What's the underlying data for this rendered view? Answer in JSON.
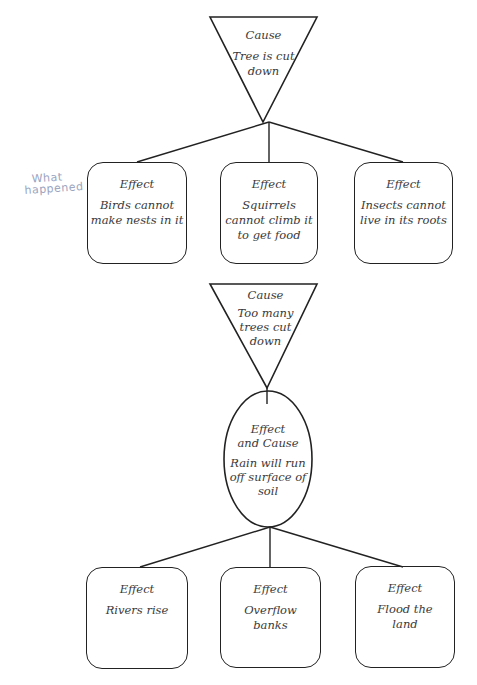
{
  "annotation": {
    "line1": "What",
    "line2": "happened"
  },
  "diagram1": {
    "cause": {
      "label": "Cause",
      "text_lines": [
        "Tree is cut",
        "down"
      ]
    },
    "effects": [
      {
        "label": "Effect",
        "text_lines": [
          "Birds cannot",
          "make nests in it"
        ]
      },
      {
        "label": "Effect",
        "text_lines": [
          "Squirrels",
          "cannot climb it",
          "to get food"
        ]
      },
      {
        "label": "Effect",
        "text_lines": [
          "Insects cannot",
          "live in its roots"
        ]
      }
    ]
  },
  "diagram2": {
    "cause": {
      "label": "Cause",
      "text_lines": [
        "Too many",
        "trees cut",
        "down"
      ]
    },
    "effect_and_cause": {
      "label_lines": [
        "Effect",
        "and Cause"
      ],
      "text_lines": [
        "Rain will run",
        "off surface of",
        "soil"
      ]
    },
    "effects": [
      {
        "label": "Effect",
        "text_lines": [
          "Rivers rise"
        ]
      },
      {
        "label": "Effect",
        "text_lines": [
          "Overflow",
          "banks"
        ]
      },
      {
        "label": "Effect",
        "text_lines": [
          "Flood the",
          "land"
        ]
      }
    ]
  },
  "colors": {
    "stroke": "#222222",
    "text": "#3a3a3a",
    "annotation": "#9aa4c0"
  }
}
